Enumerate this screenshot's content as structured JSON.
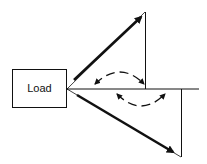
{
  "diagram": {
    "type": "phasor-diagram",
    "load_box": {
      "label": "Load"
    },
    "phasors": [
      {
        "name": "upper-phasor",
        "direction": "up-right",
        "style": "thick-arrow"
      },
      {
        "name": "lower-phasor",
        "direction": "down-right",
        "style": "thick-arrow"
      }
    ],
    "reference_line": {
      "direction": "horizontal"
    },
    "angle_indicators": [
      {
        "name": "upper-angle",
        "style": "dashed-double-headed-arc"
      },
      {
        "name": "lower-angle",
        "style": "dashed-double-headed-arc"
      }
    ],
    "colors": {
      "ink": "#111111",
      "background": "#ffffff"
    }
  }
}
